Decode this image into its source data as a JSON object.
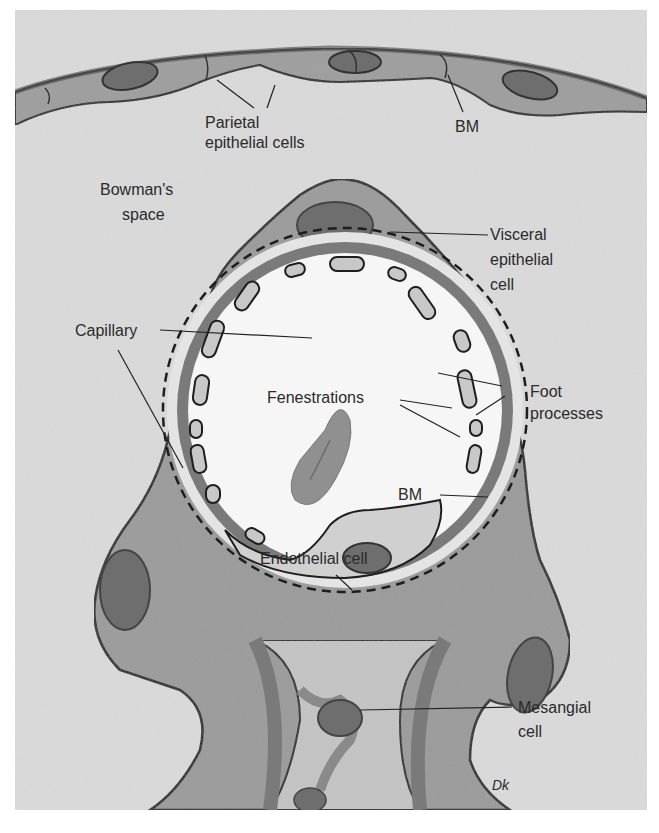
{
  "figure": {
    "type": "anatomical-illustration",
    "signature": "Dk"
  },
  "colors": {
    "page_background": "#ffffff",
    "bowmans_space": "#dcdcdc",
    "cell_cytoplasm": "#9a9a9a",
    "nucleus": "#6e6e6e",
    "basement_membrane": "#7a7a7a",
    "capillary_lumen": "#f6f6f6",
    "fenestration_fill": "#c8c8c8",
    "red_blood_cell": "#909090",
    "mesangial_matrix": "#c4c4c4",
    "outline": "#1e1e1e",
    "text": "#2a2a2a"
  },
  "labels": {
    "parietal": {
      "line1": "Parietal",
      "line2": "epithelial cells"
    },
    "bm_top": "BM",
    "bowmans": {
      "line1": "Bowman's",
      "line2": "space"
    },
    "visceral": {
      "line1": "Visceral",
      "line2": "epithelial",
      "line3": "cell"
    },
    "capillary": "Capillary",
    "foot": {
      "line1": "Foot",
      "line2": "processes"
    },
    "fenestrations": "Fenestrations",
    "bm_inner": "BM",
    "endothelial": "Endothelial cell",
    "mesangial": {
      "line1": "Mesangial",
      "line2": "cell"
    }
  }
}
